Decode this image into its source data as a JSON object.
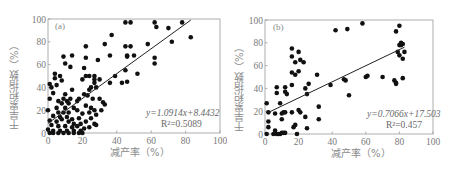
{
  "chart_data": [
    {
      "type": "scatter",
      "panel_label": "(a)",
      "title": "",
      "xlabel": "减产率（%）",
      "ylabel": "干旱累积指数（%）",
      "xlim": [
        0,
        100
      ],
      "ylim": [
        0,
        100
      ],
      "xticks": [
        0,
        20,
        40,
        60,
        80,
        100
      ],
      "yticks": [
        0,
        20,
        40,
        60,
        80,
        100
      ],
      "grid": false,
      "legend": null,
      "fit": {
        "slope": 1.0914,
        "intercept": 8.4432,
        "x_range": [
          0,
          83
        ]
      },
      "equation_text": "y=1.0914x+8.4432",
      "r2_text": "R²=0.5089",
      "points": [
        [
          45,
          97
        ],
        [
          48,
          97
        ],
        [
          62,
          97
        ],
        [
          78,
          97
        ],
        [
          63,
          93
        ],
        [
          70,
          92
        ],
        [
          37,
          86
        ],
        [
          83,
          84
        ],
        [
          72,
          80
        ],
        [
          33,
          78
        ],
        [
          58,
          78
        ],
        [
          45,
          76
        ],
        [
          48,
          76
        ],
        [
          22,
          76
        ],
        [
          9,
          67
        ],
        [
          14,
          68
        ],
        [
          22,
          66
        ],
        [
          36,
          68
        ],
        [
          46,
          67
        ],
        [
          46,
          68
        ],
        [
          50,
          68
        ],
        [
          62,
          66
        ],
        [
          62,
          61
        ],
        [
          29,
          64
        ],
        [
          10,
          61
        ],
        [
          13,
          58
        ],
        [
          21,
          57
        ],
        [
          52,
          52
        ],
        [
          45,
          55
        ],
        [
          4,
          52
        ],
        [
          7,
          50
        ],
        [
          4,
          48
        ],
        [
          8,
          46
        ],
        [
          20,
          47
        ],
        [
          22,
          50
        ],
        [
          24,
          50
        ],
        [
          27,
          50
        ],
        [
          27,
          47
        ],
        [
          30,
          47
        ],
        [
          39,
          50
        ],
        [
          27,
          44
        ],
        [
          36,
          44
        ],
        [
          43,
          44
        ],
        [
          46,
          45
        ],
        [
          1,
          43
        ],
        [
          2,
          40
        ],
        [
          5,
          42
        ],
        [
          14,
          38
        ],
        [
          25,
          40
        ],
        [
          24,
          38
        ],
        [
          28,
          40
        ],
        [
          21,
          34
        ],
        [
          23,
          33
        ],
        [
          3,
          35
        ],
        [
          10,
          34
        ],
        [
          1,
          30
        ],
        [
          6,
          28
        ],
        [
          9,
          30
        ],
        [
          11,
          28
        ],
        [
          13,
          30
        ],
        [
          18,
          30
        ],
        [
          26,
          30
        ],
        [
          30,
          30
        ],
        [
          8,
          26
        ],
        [
          12,
          26
        ],
        [
          17,
          28
        ],
        [
          22,
          24
        ],
        [
          32,
          27
        ],
        [
          33,
          25
        ],
        [
          5,
          22
        ],
        [
          10,
          22
        ],
        [
          15,
          22
        ],
        [
          17,
          20
        ],
        [
          25,
          22
        ],
        [
          27,
          20
        ],
        [
          0,
          20
        ],
        [
          6,
          18
        ],
        [
          9,
          18
        ],
        [
          12,
          18
        ],
        [
          20,
          17
        ],
        [
          24,
          18
        ],
        [
          28,
          16
        ],
        [
          31,
          20
        ],
        [
          3,
          15
        ],
        [
          7,
          14
        ],
        [
          11,
          14
        ],
        [
          14,
          12
        ],
        [
          18,
          13
        ],
        [
          25,
          13
        ],
        [
          1,
          11
        ],
        [
          5,
          10
        ],
        [
          8,
          12
        ],
        [
          12,
          10
        ],
        [
          15,
          8
        ],
        [
          19,
          8
        ],
        [
          22,
          10
        ],
        [
          27,
          8
        ],
        [
          2,
          7
        ],
        [
          6,
          6
        ],
        [
          10,
          6
        ],
        [
          14,
          5
        ],
        [
          17,
          6
        ],
        [
          21,
          4
        ],
        [
          24,
          5
        ],
        [
          28,
          7
        ],
        [
          0,
          3
        ],
        [
          3,
          2
        ],
        [
          7,
          2
        ],
        [
          11,
          2
        ],
        [
          15,
          2
        ],
        [
          19,
          2
        ],
        [
          3,
          0
        ],
        [
          6,
          0
        ],
        [
          9,
          0
        ],
        [
          12,
          0
        ],
        [
          15,
          0
        ],
        [
          18,
          0
        ],
        [
          20,
          0
        ],
        [
          1,
          0
        ]
      ]
    },
    {
      "type": "scatter",
      "panel_label": "(b)",
      "title": "",
      "xlabel": "减产率（%）",
      "ylabel": "干旱累积指数（%）",
      "xlim": [
        0,
        100
      ],
      "ylim": [
        0,
        100
      ],
      "xticks": [
        0,
        20,
        40,
        60,
        80,
        100
      ],
      "yticks": [
        0,
        20,
        40,
        60,
        80,
        100
      ],
      "grid": false,
      "legend": null,
      "fit": {
        "slope": 0.7066,
        "intercept": 17.503,
        "x_range": [
          2,
          83
        ]
      },
      "equation_text": "y=0.7066x+17.503",
      "r2_text": "R²=0.457",
      "points": [
        [
          58,
          97
        ],
        [
          80,
          95
        ],
        [
          42,
          91
        ],
        [
          49,
          92
        ],
        [
          78,
          90
        ],
        [
          81,
          80
        ],
        [
          81,
          78
        ],
        [
          82,
          79
        ],
        [
          80,
          78
        ],
        [
          16,
          75
        ],
        [
          20,
          72
        ],
        [
          79,
          72
        ],
        [
          83,
          72
        ],
        [
          16,
          68
        ],
        [
          80,
          69
        ],
        [
          82,
          66
        ],
        [
          21,
          65
        ],
        [
          18,
          63
        ],
        [
          23,
          63
        ],
        [
          16,
          54
        ],
        [
          20,
          55
        ],
        [
          18,
          52
        ],
        [
          31,
          52
        ],
        [
          60,
          50
        ],
        [
          61,
          51
        ],
        [
          70,
          50
        ],
        [
          77,
          47
        ],
        [
          78,
          45
        ],
        [
          78,
          44
        ],
        [
          82,
          49
        ],
        [
          47,
          48
        ],
        [
          48,
          47
        ],
        [
          7,
          41
        ],
        [
          12,
          41
        ],
        [
          16,
          43
        ],
        [
          26,
          44
        ],
        [
          39,
          43
        ],
        [
          7,
          36
        ],
        [
          12,
          37
        ],
        [
          13,
          35
        ],
        [
          24,
          40
        ],
        [
          25,
          35
        ],
        [
          50,
          34
        ],
        [
          1,
          27
        ],
        [
          9,
          27
        ],
        [
          2,
          19
        ],
        [
          6,
          18
        ],
        [
          10,
          18
        ],
        [
          11,
          19
        ],
        [
          12,
          19
        ],
        [
          16,
          19
        ],
        [
          20,
          21
        ],
        [
          21,
          19
        ],
        [
          32,
          24
        ],
        [
          10,
          13
        ],
        [
          24,
          15
        ],
        [
          32,
          13
        ],
        [
          2,
          11
        ],
        [
          2,
          6
        ],
        [
          17,
          6
        ],
        [
          18,
          8
        ],
        [
          25,
          5
        ],
        [
          6,
          3
        ],
        [
          1,
          0
        ],
        [
          5,
          0
        ],
        [
          7,
          0
        ],
        [
          8,
          0
        ],
        [
          9,
          0
        ],
        [
          10,
          1
        ],
        [
          11,
          1
        ],
        [
          12,
          1
        ],
        [
          19,
          0
        ]
      ]
    }
  ]
}
